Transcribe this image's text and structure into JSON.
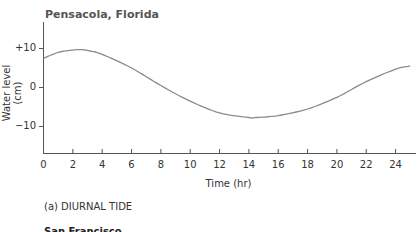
{
  "chart_data": {
    "type": "line",
    "title": "Pensacola, Florida",
    "xlabel": "Time (hr)",
    "ylabel": "Water level (cm)",
    "caption": "(a) DIURNAL TIDE",
    "xlim": [
      0,
      25
    ],
    "ylim": [
      -17,
      18
    ],
    "x_ticks": [
      "0",
      "2",
      "4",
      "6",
      "8",
      "10",
      "12",
      "14",
      "16",
      "18",
      "20",
      "22",
      "24"
    ],
    "y_ticks": [
      "+10",
      "0",
      "−10"
    ],
    "grid": false,
    "series": [
      {
        "name": "Pensacola water level",
        "color": "#8a8a8a",
        "x": [
          0,
          1,
          2,
          2.5,
          3,
          4,
          6,
          8,
          10,
          12,
          14,
          14.5,
          16,
          18,
          20,
          22,
          24,
          25
        ],
        "values": [
          7.5,
          9.0,
          9.6,
          9.7,
          9.5,
          8.5,
          5.0,
          0.5,
          -3.5,
          -6.5,
          -7.7,
          -7.7,
          -7.2,
          -5.5,
          -2.5,
          1.5,
          4.7,
          5.5
        ]
      }
    ]
  },
  "next_panel_title": "San Francisco"
}
